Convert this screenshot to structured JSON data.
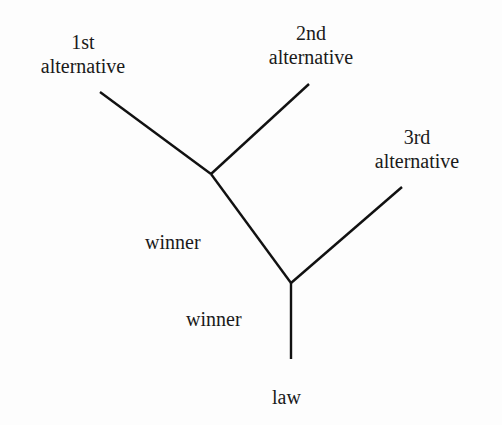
{
  "diagram": {
    "type": "tree",
    "nodes": [
      {
        "id": "alt1",
        "line1": "1st",
        "line2": "alternative"
      },
      {
        "id": "alt2",
        "line1": "2nd",
        "line2": "alternative"
      },
      {
        "id": "alt3",
        "line1": "3rd",
        "line2": "alternative"
      },
      {
        "id": "winner1",
        "label": "winner"
      },
      {
        "id": "winner2",
        "label": "winner"
      },
      {
        "id": "law",
        "label": "law"
      }
    ],
    "edges": [
      {
        "from": "alt1",
        "to": "junction1"
      },
      {
        "from": "alt2",
        "to": "junction1"
      },
      {
        "from": "junction1",
        "to": "junction2"
      },
      {
        "from": "alt3",
        "to": "junction2"
      },
      {
        "from": "junction2",
        "to": "law"
      }
    ],
    "line_color": "#111111"
  }
}
